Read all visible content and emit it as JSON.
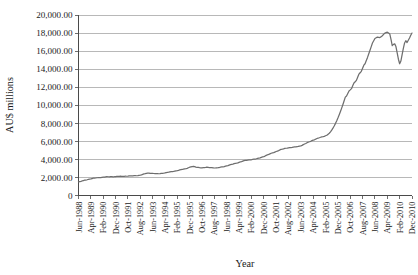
{
  "chart_data": {
    "type": "line",
    "title": "",
    "xlabel": "Year",
    "ylabel": "AU$ millions",
    "ylim": [
      0,
      20000
    ],
    "ytick_step": 2000,
    "ytick_labels": [
      "0",
      "2,000.00",
      "4,000.00",
      "6,000.00",
      "8,000.00",
      "10,000.00",
      "12,000.00",
      "14,000.00",
      "16,000.00",
      "18,000.00",
      "20,000.00"
    ],
    "ytick_values": [
      0,
      2000,
      4000,
      6000,
      8000,
      10000,
      12000,
      14000,
      16000,
      18000,
      20000
    ],
    "grid": "horizontal",
    "legend": "none",
    "line_color": "#6e6e6e",
    "xtick_rotation_deg": 90,
    "xtick_labels": [
      "Jun-1988",
      "Apr-1989",
      "Feb-1990",
      "Dec-1990",
      "Oct-1991",
      "Aug-1992",
      "Jun-1993",
      "Apr-1994",
      "Feb-1995",
      "Dec-1995",
      "Oct-1996",
      "Aug-1997",
      "Jun-1998",
      "Apr-1999",
      "Feb-2000",
      "Dec-2000",
      "Oct-2001",
      "Aug-2002",
      "Jun-2003",
      "Apr-2004",
      "Feb-2005",
      "Dec-2005",
      "Oct-2006",
      "Aug-2007",
      "Jun-2008",
      "Apr-2009",
      "Feb-2010",
      "Dec-2010"
    ],
    "xtick_interval_months": 10,
    "x_start": "Jun-1988",
    "x_end": "Dec-2010",
    "series": [
      {
        "name": "AU$ millions",
        "x_months_from_start": [
          0,
          4,
          8,
          12,
          16,
          20,
          24,
          28,
          32,
          36,
          40,
          44,
          48,
          52,
          56,
          60,
          64,
          68,
          72,
          76,
          80,
          84,
          88,
          92,
          96,
          100,
          104,
          108,
          112,
          116,
          120,
          124,
          128,
          132,
          136,
          140,
          144,
          148,
          152,
          156,
          160,
          164,
          168,
          172,
          176,
          180,
          184,
          188,
          192,
          196,
          200,
          204,
          208,
          212,
          216,
          220,
          224,
          228,
          232,
          236,
          240,
          244,
          248,
          252,
          256,
          260,
          264,
          268,
          270
        ],
        "values": [
          1500,
          1650,
          1790,
          1900,
          1980,
          2030,
          2070,
          2090,
          2110,
          2130,
          2150,
          2180,
          2220,
          2330,
          2480,
          2450,
          2400,
          2470,
          2560,
          2660,
          2760,
          2880,
          3030,
          3210,
          3120,
          3080,
          3110,
          3090,
          3060,
          3150,
          3290,
          3440,
          3600,
          3760,
          3900,
          3980,
          4060,
          4230,
          4440,
          4660,
          4880,
          5080,
          5240,
          5320,
          5380,
          5520,
          5760,
          6020,
          6250,
          6440,
          6620,
          6800,
          6990,
          7180,
          7340,
          7500,
          7660,
          7800,
          7960,
          8080,
          7930,
          7900,
          7970,
          8080,
          8400,
          8900,
          9500,
          9700,
          9780
        ]
      }
    ],
    "key_points": {
      "start_value": 1500,
      "peak_value": 18100,
      "peak_label": "Aug-2007 to early-2008",
      "trough_after_peak": 14600,
      "trough_label": "Apr-2009",
      "end_value": 18000
    }
  }
}
